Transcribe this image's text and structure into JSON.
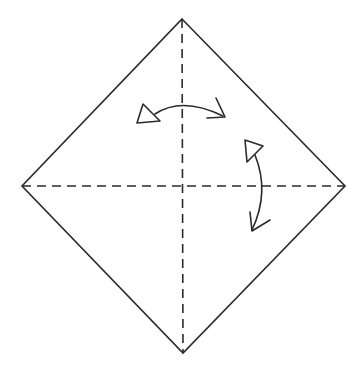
{
  "diagram": {
    "type": "origami-fold-diagram",
    "colors": {
      "background": "#ffffff",
      "line": "#2a2a2a"
    },
    "paper": {
      "shape": "diamond",
      "vertices": {
        "top": [
          182,
          19
        ],
        "right": [
          345,
          186
        ],
        "bottom": [
          183,
          353
        ],
        "left": [
          22,
          186
        ]
      }
    },
    "creases": [
      {
        "name": "vertical-crease",
        "style": "dashed",
        "from": [
          182,
          19
        ],
        "to": [
          183,
          353
        ]
      },
      {
        "name": "horizontal-crease",
        "style": "dashed",
        "from": [
          22,
          186
        ],
        "to": [
          345,
          186
        ]
      }
    ],
    "arrows": [
      {
        "name": "horizontal-fold-unfold-arrow",
        "meaning": "fold and unfold along vertical crease",
        "hollow_head_end": "left",
        "open_head_end": "right"
      },
      {
        "name": "vertical-fold-unfold-arrow",
        "meaning": "fold and unfold along horizontal crease",
        "hollow_head_end": "top",
        "open_head_end": "bottom"
      }
    ]
  }
}
